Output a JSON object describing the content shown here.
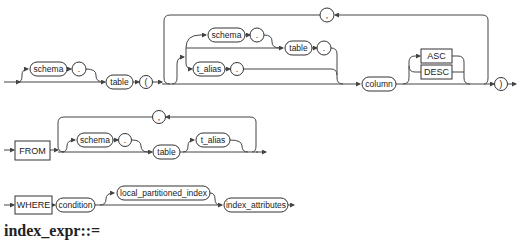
{
  "diagram": {
    "row1": {
      "nodes": {
        "schema": "schema",
        "dot1": ".",
        "table": "table",
        "lparen": "(",
        "comma": ",",
        "inner_schema": "schema",
        "inner_dot1": ".",
        "inner_table": "table",
        "inner_dot2": ".",
        "t_alias": "t_alias",
        "t_alias_dot": ".",
        "column": "column",
        "asc": "ASC",
        "desc": "DESC",
        "rparen": ")"
      }
    },
    "row2": {
      "nodes": {
        "from": "FROM",
        "comma": ",",
        "schema": "schema",
        "dot": ".",
        "table": "table",
        "t_alias": "t_alias"
      }
    },
    "row3": {
      "nodes": {
        "where": "WHERE",
        "condition": "condition",
        "local_partitioned_index": "local_partitioned_index",
        "index_attributes": "index_attributes"
      }
    },
    "heading": "index_expr::="
  }
}
